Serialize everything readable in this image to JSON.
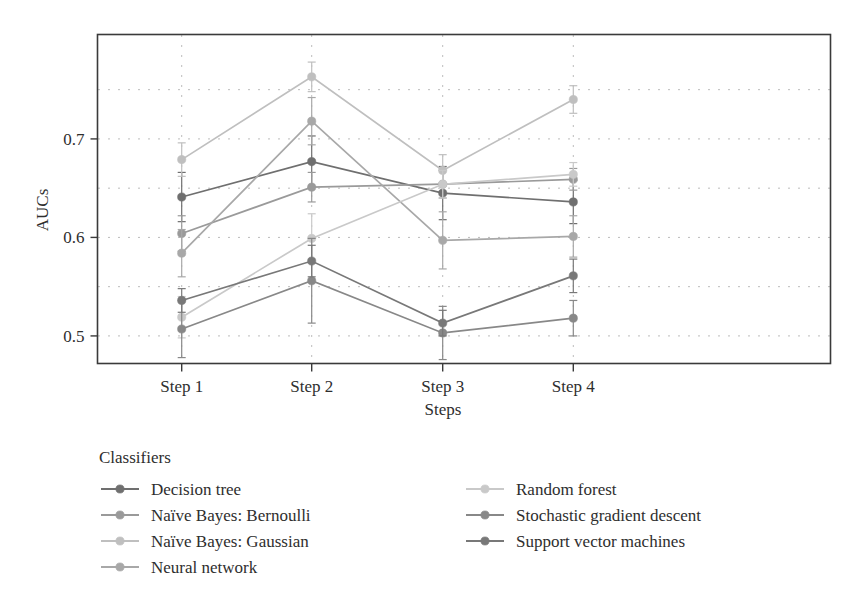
{
  "chart_data": {
    "type": "line",
    "title": "",
    "xlabel": "Steps",
    "ylabel": "AUCs",
    "categories": [
      "Step 1",
      "Step 2",
      "Step 3",
      "Step 4"
    ],
    "x": [
      1,
      2,
      3,
      4
    ],
    "ylim": [
      0.472,
      0.806
    ],
    "yticks": [
      0.5,
      0.6,
      0.7
    ],
    "ytick_labels": [
      "0.5",
      "0.6",
      "0.7"
    ],
    "gridlines_y": [
      0.5,
      0.55,
      0.6,
      0.65,
      0.7,
      0.75
    ],
    "grid": "dotted",
    "grid_color": "#b4b4b4",
    "legend_position": "below-plot",
    "legend_title": "Classifiers",
    "errorbars": true,
    "marker": "circle",
    "series": [
      {
        "name": "Decision tree",
        "color": "#6f6f6f",
        "values": [
          0.641,
          0.677,
          0.645,
          0.636
        ],
        "err_low": [
          0.616,
          0.651,
          0.618,
          0.614
        ],
        "err_high": [
          0.666,
          0.703,
          0.672,
          0.658
        ]
      },
      {
        "name": "Naïve Bayes: Bernoulli",
        "color": "#9a9a9a",
        "values": [
          0.604,
          0.651,
          0.654,
          0.659
        ],
        "err_low": [
          0.586,
          0.636,
          0.64,
          0.648
        ],
        "err_high": [
          0.622,
          0.666,
          0.668,
          0.67
        ]
      },
      {
        "name": "Naïve Bayes: Gaussian",
        "color": "#bfbfbf",
        "values": [
          0.679,
          0.763,
          0.668,
          0.74
        ],
        "err_low": [
          0.662,
          0.748,
          0.652,
          0.726
        ],
        "err_high": [
          0.696,
          0.778,
          0.684,
          0.754
        ]
      },
      {
        "name": "Neural network",
        "color": "#a8a8a8",
        "values": [
          0.584,
          0.718,
          0.597,
          0.601
        ],
        "err_low": [
          0.56,
          0.694,
          0.568,
          0.58
        ],
        "err_high": [
          0.608,
          0.742,
          0.626,
          0.622
        ]
      },
      {
        "name": "Random forest",
        "color": "#c9c9c9",
        "values": [
          0.519,
          0.599,
          0.654,
          0.664
        ],
        "err_low": [
          0.498,
          0.574,
          0.64,
          0.652
        ],
        "err_high": [
          0.54,
          0.624,
          0.668,
          0.676
        ]
      },
      {
        "name": "Stochastic gradient descent",
        "color": "#888888",
        "values": [
          0.507,
          0.556,
          0.503,
          0.518
        ],
        "err_low": [
          0.478,
          0.513,
          0.476,
          0.5
        ],
        "err_high": [
          0.536,
          0.599,
          0.53,
          0.536
        ]
      },
      {
        "name": "Support vector machines",
        "color": "#787878",
        "values": [
          0.536,
          0.576,
          0.513,
          0.561
        ],
        "err_low": [
          0.524,
          0.56,
          0.5,
          0.544
        ],
        "err_high": [
          0.548,
          0.592,
          0.526,
          0.578
        ]
      }
    ]
  },
  "axes": {
    "y_title": "AUCs",
    "x_title": "Steps",
    "y_tick_0": "0.7",
    "y_tick_1": "0.6",
    "y_tick_2": "0.5",
    "x_tick_0": "Step 1",
    "x_tick_1": "Step 2",
    "x_tick_2": "Step 3",
    "x_tick_3": "Step 4"
  },
  "legend": {
    "title": "Classifiers",
    "left_column": [
      {
        "label": "Decision tree",
        "color": "#6f6f6f"
      },
      {
        "label": "Naïve Bayes: Bernoulli",
        "color": "#9a9a9a"
      },
      {
        "label": "Naïve Bayes: Gaussian",
        "color": "#bfbfbf"
      },
      {
        "label": "Neural network",
        "color": "#a8a8a8"
      }
    ],
    "right_column": [
      {
        "label": "Random forest",
        "color": "#c9c9c9"
      },
      {
        "label": "Stochastic gradient descent",
        "color": "#888888"
      },
      {
        "label": "Support vector machines",
        "color": "#787878"
      }
    ]
  }
}
